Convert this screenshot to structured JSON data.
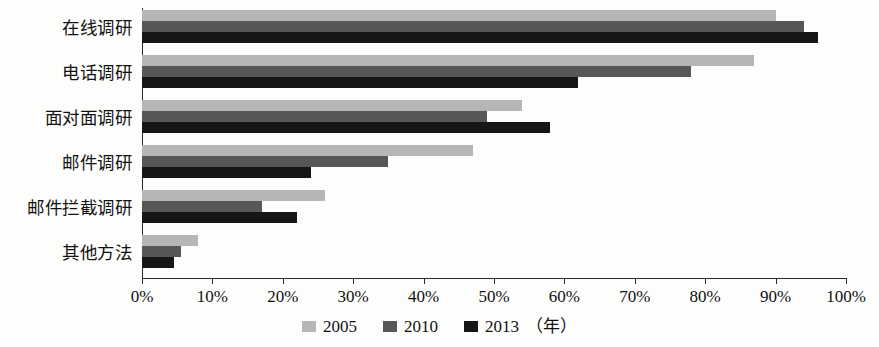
{
  "chart_data": {
    "type": "bar",
    "orientation": "horizontal",
    "title": "",
    "subtitle": "",
    "xlabel": "",
    "ylabel": "",
    "xlim": [
      0,
      100
    ],
    "xtick_labels": [
      "0%",
      "10%",
      "20%",
      "30%",
      "40%",
      "50%",
      "60%",
      "70%",
      "80%",
      "90%",
      "100%"
    ],
    "xtick_values": [
      0,
      10,
      20,
      30,
      40,
      50,
      60,
      70,
      80,
      90,
      100
    ],
    "grid": false,
    "legend_position": "bottom-center",
    "legend_suffix": "（年）",
    "categories": [
      "在线调研",
      "电话调研",
      "面对面调研",
      "邮件调研",
      "邮件拦截调研",
      "其他方法"
    ],
    "series": [
      {
        "name": "2005",
        "color": "#b6b6b6",
        "values": [
          90,
          87,
          54,
          47,
          26,
          8
        ]
      },
      {
        "name": "2010",
        "color": "#575757",
        "values": [
          94,
          78,
          49,
          35,
          17,
          5.5
        ]
      },
      {
        "name": "2013",
        "color": "#161616",
        "values": [
          96,
          62,
          58,
          24,
          22,
          4.5
        ]
      }
    ]
  }
}
